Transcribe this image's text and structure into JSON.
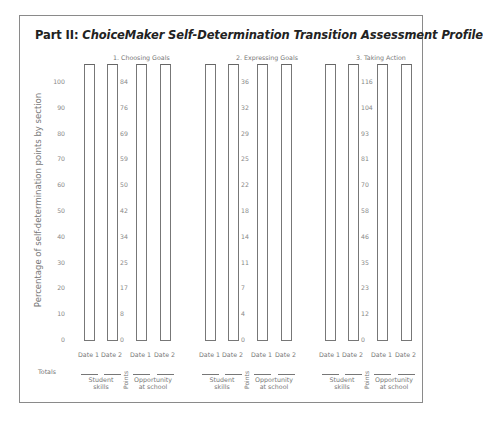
{
  "title_prefix": "Part II: ",
  "title_italic": "ChoiceMaker Self-Determination Transition Assessment Profile",
  "y_axis_label": "Percentage of self-determination points by section",
  "left_ticks": [
    "100",
    "90",
    "80",
    "70",
    "60",
    "50",
    "40",
    "30",
    "20",
    "10",
    "0"
  ],
  "groups": [
    {
      "title": "1.   Choosing Goals",
      "point_ticks": [
        "84",
        "76",
        "69",
        "59",
        "50",
        "42",
        "34",
        "25",
        "17",
        "8",
        "0"
      ]
    },
    {
      "title": "2.   Expressing Goals",
      "point_ticks": [
        "36",
        "32",
        "29",
        "25",
        "22",
        "18",
        "14",
        "11",
        "7",
        "4",
        "0"
      ]
    },
    {
      "title": "3.   Taking Action",
      "point_ticks": [
        "116",
        "104",
        "93",
        "81",
        "70",
        "58",
        "46",
        "35",
        "23",
        "12",
        "0"
      ]
    }
  ],
  "date_labels": [
    "Date 1",
    "Date 2",
    "Date 1",
    "Date 2"
  ],
  "totals_label": "Totals",
  "student_skills": [
    "Student",
    "skills"
  ],
  "opportunity": [
    "Opportunity",
    "at school"
  ],
  "points_label": "Points",
  "chart_data": {
    "type": "bar",
    "title": "Part II: ChoiceMaker Self-Determination Transition Assessment Profile",
    "ylabel": "Percentage of self-determination points by section",
    "ylim": [
      0,
      100
    ],
    "yticks": [
      0,
      10,
      20,
      30,
      40,
      50,
      60,
      70,
      80,
      90,
      100
    ],
    "grid": false,
    "sections": [
      {
        "name": "1. Choosing Goals",
        "points_scale": [
          0,
          8,
          17,
          25,
          34,
          42,
          50,
          59,
          69,
          76,
          84
        ],
        "categories": [
          "Student skills Date 1",
          "Student skills Date 2",
          "Opportunity at school Date 1",
          "Opportunity at school Date 2"
        ],
        "values": [
          null,
          null,
          null,
          null
        ]
      },
      {
        "name": "2. Expressing Goals",
        "points_scale": [
          0,
          4,
          7,
          11,
          14,
          18,
          22,
          25,
          29,
          32,
          36
        ],
        "categories": [
          "Student skills Date 1",
          "Student skills Date 2",
          "Opportunity at school Date 1",
          "Opportunity at school Date 2"
        ],
        "values": [
          null,
          null,
          null,
          null
        ]
      },
      {
        "name": "3. Taking Action",
        "points_scale": [
          0,
          12,
          23,
          35,
          46,
          58,
          70,
          81,
          93,
          104,
          116
        ],
        "categories": [
          "Student skills Date 1",
          "Student skills Date 2",
          "Opportunity at school Date 1",
          "Opportunity at school Date 2"
        ],
        "values": [
          null,
          null,
          null,
          null
        ]
      }
    ],
    "note": "Blank assessment profile: all bars are empty outlines (no values filled in)."
  }
}
